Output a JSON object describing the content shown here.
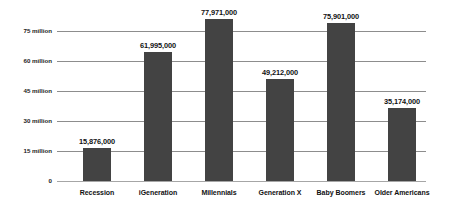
{
  "chart_data": {
    "type": "bar",
    "title": "",
    "subtitle": "",
    "xlabel": "",
    "ylabel": "",
    "categories": [
      "Recession",
      "iGeneration",
      "Millennials",
      "Generation X",
      "Baby Boomers",
      "Older Americans"
    ],
    "values": [
      15876000,
      61995000,
      77971000,
      49212000,
      75901000,
      35174000
    ],
    "value_labels": [
      "15,876,000",
      "61,995,000",
      "77,971,000",
      "49,212,000",
      "75,901,000",
      "35,174,000"
    ],
    "ylim": [
      0,
      82500000
    ],
    "yticks": [
      0,
      15000000,
      30000000,
      45000000,
      60000000,
      75000000
    ],
    "ytick_labels": [
      "0",
      "15 million",
      "30 million",
      "45 million",
      "60 million",
      "75 million"
    ],
    "grid": true,
    "legend": "none",
    "series": [
      {
        "name": "Population",
        "color": "#434343",
        "values": [
          15876000,
          61995000,
          77971000,
          49212000,
          75901000,
          35174000
        ]
      }
    ],
    "colors": {
      "bar": "#434343",
      "gridline": "#8d8d8d",
      "axis": "#a6a6a6",
      "text": "#111111",
      "background": "#ffffff"
    }
  }
}
